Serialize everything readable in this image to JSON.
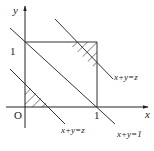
{
  "diagram": {
    "type": "geometry",
    "axes": {
      "x_label": "x",
      "y_label": "y",
      "origin_label": "O",
      "x_tick": "1",
      "y_tick": "1"
    },
    "lines": [
      {
        "label": "x+y=z",
        "position": "upper-right",
        "meaning": "z > 1"
      },
      {
        "label": "x+y=1",
        "position": "middle",
        "meaning": "diagonal"
      },
      {
        "label": "x+y=z",
        "position": "lower-left",
        "meaning": "z < 1"
      }
    ],
    "hatched_regions": [
      {
        "name": "upper-right-triangle",
        "bounded_by": "x=1, y=1, x+y=z"
      },
      {
        "name": "lower-left-triangle",
        "bounded_by": "x=0, y=0, x+y=z"
      }
    ],
    "colors": {
      "stroke": "#333333",
      "background": "#ffffff"
    }
  }
}
